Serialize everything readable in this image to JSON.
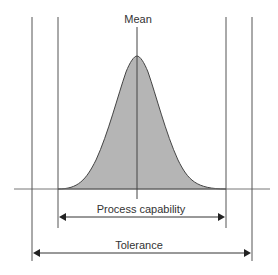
{
  "diagram": {
    "labels": {
      "mean": "Mean",
      "process_capability": "Process capability",
      "tolerance": "Tolerance"
    },
    "colors": {
      "line": "#555555",
      "curve_fill": "#b5b5b5",
      "curve_stroke": "#444444",
      "text": "#333333"
    }
  }
}
